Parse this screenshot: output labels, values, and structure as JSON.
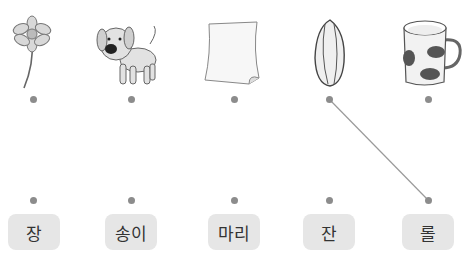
{
  "pictures": [
    {
      "name": "flower",
      "icon": "flower-icon"
    },
    {
      "name": "dog",
      "icon": "dog-icon"
    },
    {
      "name": "paper",
      "icon": "paper-icon"
    },
    {
      "name": "seed",
      "icon": "seed-icon"
    },
    {
      "name": "mug",
      "icon": "mug-icon"
    }
  ],
  "words": [
    "장",
    "송이",
    "마리",
    "잔",
    "롤"
  ],
  "connections": [
    {
      "from": 3,
      "to": 4
    }
  ],
  "colors": {
    "dot": "#8c8c8c",
    "box": "#e6e6e6",
    "line": "#9a9a9a"
  }
}
